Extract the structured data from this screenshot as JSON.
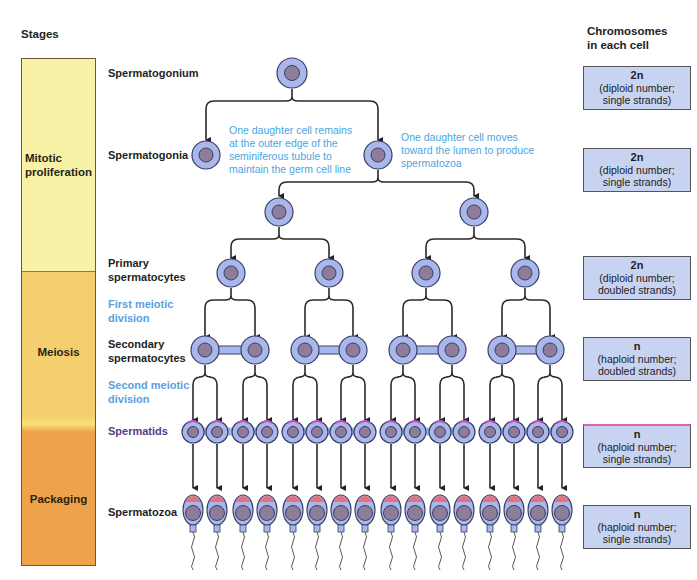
{
  "headers": {
    "stages": "Stages",
    "chromosomes_line1": "Chromosomes",
    "chromosomes_line2": "in each cell"
  },
  "stages": [
    {
      "label_line1": "Mitotic",
      "label_line2": "proliferation",
      "color": "#f8f2a6"
    },
    {
      "label_line1": "Meiosis",
      "label_line2": "",
      "color": "#f4cf6e"
    },
    {
      "label_line1": "Packaging",
      "label_line2": "",
      "color": "#eea24a"
    }
  ],
  "rows": {
    "spermatogonium": "Spermatogonium",
    "spermatogonia": "Spermatogonia",
    "primary_1": "Primary",
    "primary_2": "spermatocytes",
    "first_div_1": "First meiotic",
    "first_div_2": "division",
    "secondary_1": "Secondary",
    "secondary_2": "spermatocytes",
    "second_div_1": "Second meiotic",
    "second_div_2": "division",
    "spermatids": "Spermatids",
    "spermatozoa": "Spermatozoa"
  },
  "notes": {
    "left": [
      "One daughter cell remains",
      "at the outer edge of the",
      "seminiferous tubule to",
      "maintain the germ cell line"
    ],
    "right": [
      "One daughter cell moves",
      "toward the lumen to produce",
      "spermatozoa"
    ]
  },
  "chromosome_boxes": [
    {
      "value": "2n",
      "line1": "(diploid number;",
      "line2": "single strands)"
    },
    {
      "value": "2n",
      "line1": "(diploid number;",
      "line2": "single strands)"
    },
    {
      "value": "2n",
      "line1": "(diploid number;",
      "line2": "doubled strands)"
    },
    {
      "value": "n",
      "line1": "(haploid number;",
      "line2": "doubled strands)"
    },
    {
      "value": "n",
      "line1": "(haploid number;",
      "line2": "single strands)"
    },
    {
      "value": "n",
      "line1": "(haploid number;",
      "line2": "single strands)"
    }
  ],
  "colors": {
    "cell_fill": "#a9b7ea",
    "cell_border": "#3a3f66",
    "nucleus": "#8e7c98",
    "acrosome": "#e8707c",
    "arrow": "#222222",
    "note_blue": "#4aa6e0"
  }
}
